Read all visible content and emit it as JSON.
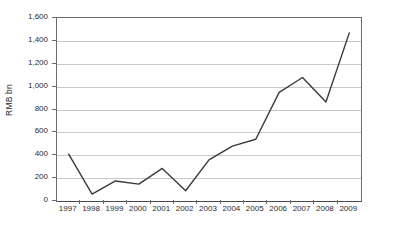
{
  "chart_data": {
    "type": "line",
    "title": "",
    "subtitle": "",
    "xlabel": "",
    "ylabel": "RMB bn",
    "categories": [
      "1997",
      "1998",
      "1999",
      "2000",
      "2001",
      "2002",
      "2003",
      "2004",
      "2005",
      "2006",
      "2007",
      "2008",
      "2009"
    ],
    "values": [
      410,
      60,
      175,
      148,
      285,
      90,
      360,
      480,
      540,
      950,
      1080,
      865,
      1470
    ],
    "series": [
      {
        "name": "RMB bn",
        "values": [
          410,
          60,
          175,
          148,
          285,
          90,
          360,
          480,
          540,
          950,
          1080,
          865,
          1470
        ]
      }
    ],
    "ylim": [
      0,
      1600
    ],
    "ytick_values": [
      0,
      200,
      400,
      600,
      800,
      1000,
      1200,
      1400,
      1600
    ],
    "ytick_labels": [
      "0",
      "200",
      "400",
      "600",
      "800",
      "1,000",
      "1,200",
      "1,400",
      "1,600"
    ],
    "grid": true,
    "grid_axis": "y",
    "legend": false,
    "legend_position": "none",
    "line_color": "#3a3a3a",
    "grid_color": "#c9c9c9",
    "axis_color": "#6a6a6a",
    "background_color": "#ffffff",
    "markers": false,
    "annotations": []
  }
}
